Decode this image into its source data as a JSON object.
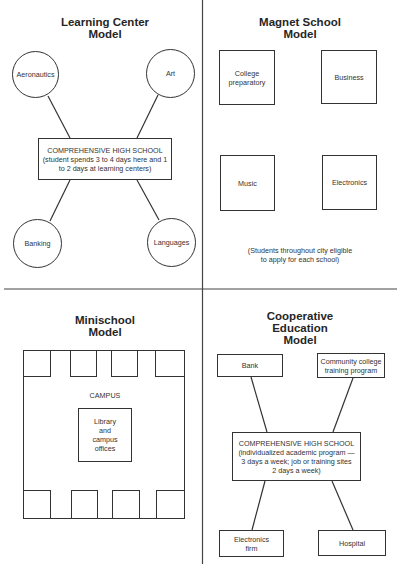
{
  "panels": {
    "learning_center": {
      "title": "Learning Center\nModel",
      "hub": "COMPREHENSIVE HIGH SCHOOL\n(student spends 3 to 4 days here and 1\nto 2 days at learning centers)",
      "centers": [
        "Aeronautics",
        "Art",
        "Banking",
        "Languages"
      ]
    },
    "magnet_school": {
      "title": "Magnet School\nModel",
      "schools": [
        "College\npreparatory",
        "Business",
        "Music",
        "Electronics"
      ],
      "note": "(Students throughout city eligible\nto apply for each school)"
    },
    "minischool": {
      "title": "Minischool\nModel",
      "campus_label": "CAMPUS",
      "library_label": "Library\nand\ncampus\noffices"
    },
    "cooperative_education": {
      "title": "Cooperative\nEducation\nModel",
      "hub": "COMPREHENSIVE HIGH SCHOOL\n(individualized academic program —\n3 days a week; job or training sites\n2 days a week)",
      "sites": [
        "Bank",
        "Community college\ntraining program",
        "Electronics\nfirm",
        "Hospital"
      ]
    }
  },
  "colors": {
    "line": "#333333",
    "background": "#ffffff",
    "text": "#2a2a2a"
  }
}
